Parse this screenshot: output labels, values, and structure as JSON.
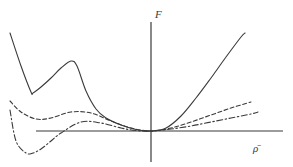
{
  "chart_data": {
    "type": "line",
    "title": "",
    "xlabel": "ρ̄",
    "ylabel": "F",
    "xlim": [
      -14.1,
      13.2
    ],
    "ylim": [
      -3.1,
      11.0
    ],
    "grid": false,
    "legend": "none",
    "axes_style": "cross-at-origin, no ticks",
    "series": [
      {
        "name": "solid",
        "style": "solid",
        "x": [
          -14.1,
          -13.0,
          -12.0,
          -11.8,
          -11.0,
          -10.0,
          -9.0,
          -8.0,
          -7.4,
          -6.5,
          -5.5,
          -4.5,
          -3.0,
          -1.5,
          0.0,
          1.5,
          3.0,
          4.5,
          6.0,
          7.5,
          9.0,
          9.4
        ],
        "y": [
          9.8,
          6.5,
          3.9,
          3.8,
          4.4,
          5.3,
          6.3,
          7.0,
          6.5,
          4.0,
          2.2,
          1.3,
          0.6,
          0.15,
          0.0,
          0.3,
          1.5,
          3.3,
          5.3,
          7.4,
          9.4,
          9.8
        ]
      },
      {
        "name": "dashed",
        "style": "dashed",
        "x": [
          -14.1,
          -13.0,
          -11.5,
          -10.0,
          -8.0,
          -6.0,
          -4.0,
          -2.0,
          0.0,
          2.0,
          4.0,
          6.0,
          8.0,
          10.0
        ],
        "y": [
          3.0,
          1.9,
          1.2,
          1.3,
          1.9,
          1.8,
          1.0,
          0.3,
          0.0,
          0.3,
          0.9,
          1.6,
          2.3,
          2.9
        ]
      },
      {
        "name": "dash-dot",
        "style": "dash-dot",
        "x": [
          -14.1,
          -13.5,
          -12.5,
          -11.8,
          -11.0,
          -10.0,
          -9.0,
          -7.0,
          -5.0,
          -3.0,
          -1.5,
          0.0,
          2.0,
          4.0,
          6.0,
          8.0,
          10.0,
          10.7
        ],
        "y": [
          2.1,
          -1.0,
          -2.2,
          -2.2,
          -1.8,
          -1.0,
          -0.2,
          0.9,
          0.8,
          0.3,
          0.05,
          0.0,
          0.2,
          0.5,
          0.9,
          1.3,
          1.7,
          1.9
        ]
      }
    ]
  }
}
